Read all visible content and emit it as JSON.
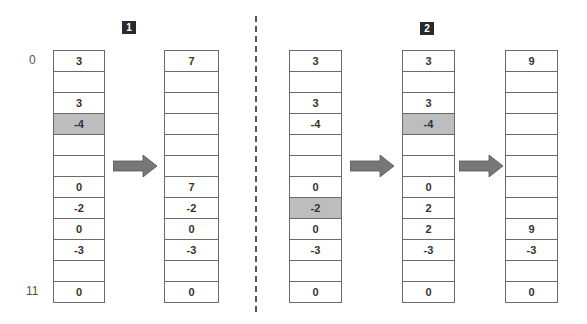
{
  "colors": {
    "border": "#6a6a6a",
    "highlight": "#bdbdbd",
    "text": "#333333",
    "badge_bg": "#2a2a2a",
    "arrow": "#777777"
  },
  "index_labels": {
    "first": "0",
    "last": "11"
  },
  "steps": [
    {
      "badge": "1"
    },
    {
      "badge": "2"
    }
  ],
  "columns": [
    {
      "section": 1,
      "cells": [
        "3",
        "",
        "3",
        "-4",
        "",
        "",
        "0",
        "-2",
        "0",
        "-3",
        "",
        "0"
      ],
      "highlight": [
        3
      ]
    },
    {
      "section": 1,
      "cells": [
        "7",
        "",
        "",
        "",
        "",
        "",
        "7",
        "-2",
        "0",
        "-3",
        "",
        "0"
      ],
      "highlight": []
    },
    {
      "section": 2,
      "cells": [
        "3",
        "",
        "3",
        "-4",
        "",
        "",
        "0",
        "-2",
        "0",
        "-3",
        "",
        "0"
      ],
      "highlight": [
        7
      ]
    },
    {
      "section": 2,
      "cells": [
        "3",
        "",
        "3",
        "-4",
        "",
        "",
        "0",
        "2",
        "2",
        "-3",
        "",
        "0"
      ],
      "highlight": [
        3
      ]
    },
    {
      "section": 2,
      "cells": [
        "9",
        "",
        "",
        "",
        "",
        "",
        "",
        "",
        "9",
        "-3",
        "",
        "0"
      ],
      "highlight": []
    }
  ]
}
